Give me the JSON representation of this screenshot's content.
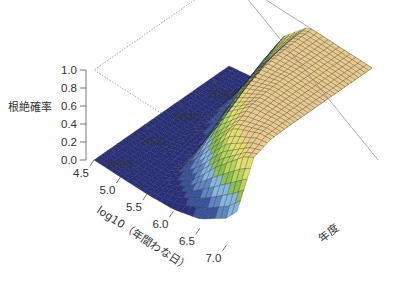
{
  "chart_data": {
    "type": "surface3d",
    "title": "",
    "zlabel": "根絶確率",
    "ylabel": "log10（年間わな日）",
    "xlabel": "年度",
    "z_ticks": [
      "0.0",
      "0.2",
      "0.4",
      "0.6",
      "0.8",
      "1.0"
    ],
    "y_ticks": [
      "4.5",
      "5.0",
      "5.5",
      "6.0",
      "6.5",
      "7.0"
    ],
    "x_ticks": [
      "2020",
      "2030",
      "2040",
      "2050"
    ],
    "zlim": [
      0,
      1
    ],
    "ylim": [
      4.5,
      7.2
    ],
    "xlim": [
      2015,
      2055
    ],
    "grid": false,
    "legend": "none",
    "colormap": [
      "#283080",
      "#3A55A0",
      "#5E86C4",
      "#86B6DE",
      "#8CC04A",
      "#B5D45A",
      "#E3DF6E",
      "#EACB8C"
    ],
    "x": [
      2015,
      2020,
      2025,
      2030,
      2035,
      2040,
      2045,
      2050,
      2055
    ],
    "y": [
      4.5,
      5.0,
      5.5,
      6.0,
      6.5,
      7.0,
      7.2
    ],
    "z_rows_by_y": [
      [
        0.0,
        0.0,
        0.0,
        0.0,
        0.0,
        0.0,
        0.0,
        0.0,
        0.0
      ],
      [
        0.0,
        0.0,
        0.0,
        0.0,
        0.0,
        0.01,
        0.02,
        0.03,
        0.05
      ],
      [
        0.0,
        0.02,
        0.05,
        0.1,
        0.18,
        0.3,
        0.45,
        0.6,
        0.7
      ],
      [
        0.02,
        0.2,
        0.45,
        0.7,
        0.85,
        0.93,
        0.97,
        0.99,
        1.0
      ],
      [
        0.1,
        0.55,
        0.85,
        0.96,
        0.99,
        1.0,
        1.0,
        1.0,
        1.0
      ],
      [
        0.3,
        0.85,
        0.98,
        1.0,
        1.0,
        1.0,
        1.0,
        1.0,
        1.0
      ],
      [
        0.45,
        0.92,
        0.99,
        1.0,
        1.0,
        1.0,
        1.0,
        1.0,
        1.0
      ]
    ]
  }
}
